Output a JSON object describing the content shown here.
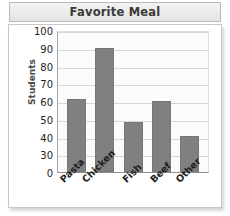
{
  "chart_data": {
    "type": "bar",
    "title": "Favorite Meal",
    "xlabel": "",
    "ylabel": "Students",
    "categories": [
      "Pasta",
      "Chicken",
      "Fish",
      "Beef",
      "Other"
    ],
    "values": [
      61,
      90,
      48,
      60,
      40
    ],
    "ylim": [
      0,
      100
    ],
    "ytick_labels": [
      "100",
      "90",
      "80",
      "70",
      "60",
      "50",
      "40",
      "30",
      "0"
    ],
    "grid": true,
    "legend": false,
    "bar_color": "#808080",
    "plot_background": "#fbfbfb",
    "title_color": "#3a3a3a"
  }
}
